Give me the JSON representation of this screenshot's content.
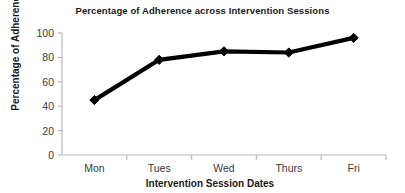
{
  "chart_data": {
    "type": "line",
    "title": "Percentage of Adherence across Intervention Sessions",
    "xlabel": "Intervention Session Dates",
    "ylabel": "Percentage of Adherence",
    "categories": [
      "Mon",
      "Tues",
      "Wed",
      "Thurs",
      "Fri"
    ],
    "values": [
      45,
      78,
      85,
      84,
      96
    ],
    "ylim": [
      0,
      100
    ],
    "ytick_labels": [
      "0",
      "20",
      "40",
      "60",
      "80",
      "100"
    ],
    "ytick_values": [
      0,
      20,
      40,
      60,
      80,
      100
    ],
    "grid": false,
    "legend": null,
    "series": [
      {
        "name": "Adherence",
        "values": [
          45,
          78,
          85,
          84,
          96
        ],
        "color": "#000000",
        "marker": "diamond"
      }
    ],
    "colors": {
      "line": "#000000",
      "marker": "#000000",
      "axis": "#b8b8b8",
      "text": "#1a1a1a",
      "tick_text": "#3a3a3a",
      "background": "#ffffff"
    }
  }
}
